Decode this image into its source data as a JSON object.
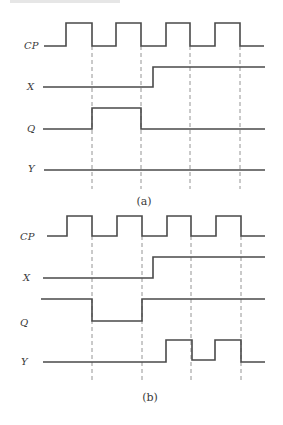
{
  "figure": {
    "panels": [
      {
        "id": "a",
        "caption": "(a)",
        "caption_pos": [
          144,
          205
        ],
        "guides": {
          "x": [
            92,
            141,
            190,
            240
          ],
          "y_top": 46,
          "y_bottom": 189
        },
        "signals": [
          {
            "name": "CP",
            "label_pos": [
              24,
              49
            ],
            "points": [
              [
                44,
                46
              ],
              [
                66,
                46
              ],
              [
                66,
                23
              ],
              [
                92,
                23
              ],
              [
                92,
                46
              ],
              [
                116,
                46
              ],
              [
                116,
                23
              ],
              [
                141,
                23
              ],
              [
                141,
                46
              ],
              [
                166,
                46
              ],
              [
                166,
                23
              ],
              [
                190,
                23
              ],
              [
                190,
                46
              ],
              [
                215,
                46
              ],
              [
                215,
                23
              ],
              [
                240,
                23
              ],
              [
                240,
                46
              ],
              [
                264,
                46
              ]
            ]
          },
          {
            "name": "X",
            "label_pos": [
              27,
              90
            ],
            "points": [
              [
                43,
                87
              ],
              [
                153,
                87
              ],
              [
                153,
                67
              ],
              [
                265,
                67
              ]
            ]
          },
          {
            "name": "Q",
            "label_pos": [
              27,
              132
            ],
            "points": [
              [
                43,
                129
              ],
              [
                92,
                129
              ],
              [
                92,
                108
              ],
              [
                141,
                108
              ],
              [
                141,
                129
              ],
              [
                265,
                129
              ]
            ]
          },
          {
            "name": "Y",
            "label_pos": [
              28,
              172
            ],
            "points": [
              [
                44,
                170
              ],
              [
                265,
                170
              ]
            ]
          }
        ]
      },
      {
        "id": "b",
        "caption": "(b)",
        "caption_pos": [
          150,
          401
        ],
        "guides": {
          "x": [
            92,
            142,
            191,
            241
          ],
          "y_top": 236,
          "y_bottom": 380
        },
        "signals": [
          {
            "name": "CP",
            "label_pos": [
              20,
              240
            ],
            "points": [
              [
                47,
                236
              ],
              [
                67,
                236
              ],
              [
                67,
                216
              ],
              [
                92,
                216
              ],
              [
                92,
                236
              ],
              [
                117,
                236
              ],
              [
                117,
                216
              ],
              [
                142,
                216
              ],
              [
                142,
                236
              ],
              [
                167,
                236
              ],
              [
                167,
                216
              ],
              [
                191,
                216
              ],
              [
                191,
                236
              ],
              [
                216,
                236
              ],
              [
                216,
                216
              ],
              [
                241,
                216
              ],
              [
                241,
                236
              ],
              [
                265,
                236
              ]
            ]
          },
          {
            "name": "X",
            "label_pos": [
              23,
              281
            ],
            "points": [
              [
                43,
                278
              ],
              [
                153,
                278
              ],
              [
                153,
                257
              ],
              [
                265,
                257
              ]
            ]
          },
          {
            "name": "Q",
            "label_pos": [
              20,
              326
            ],
            "points": [
              [
                41,
                299
              ],
              [
                92,
                299
              ],
              [
                92,
                321
              ],
              [
                142,
                321
              ],
              [
                142,
                299
              ],
              [
                265,
                299
              ]
            ]
          },
          {
            "name": "Y",
            "label_pos": [
              21,
              365
            ],
            "points": [
              [
                43,
                362
              ],
              [
                166,
                362
              ],
              [
                166,
                340
              ],
              [
                192,
                340
              ],
              [
                192,
                360
              ],
              [
                215,
                360
              ],
              [
                215,
                340
              ],
              [
                241,
                340
              ],
              [
                241,
                362
              ],
              [
                265,
                362
              ]
            ]
          }
        ]
      }
    ]
  },
  "labels": {
    "a": {
      "cp": "CP",
      "x": "X",
      "q": "Q",
      "y": "Y",
      "caption": "(a)"
    },
    "b": {
      "cp": "CP",
      "x": "X",
      "q": "Q",
      "y": "Y",
      "caption": "(b)"
    }
  },
  "colors": {
    "waveform": "#4a4a4a",
    "guide": "#7a7a7a",
    "text": "#3a3a3a",
    "background": "#ffffff"
  }
}
